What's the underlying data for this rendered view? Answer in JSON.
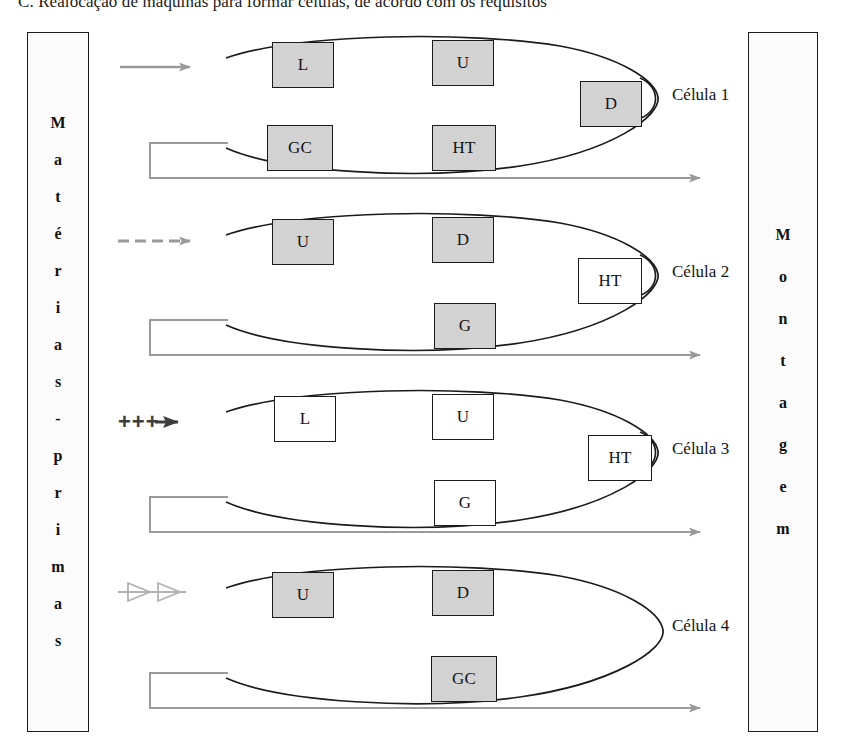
{
  "caption": {
    "text": "C. Realocação de máquinas para formar células, de acordo com os requisitos"
  },
  "panels": {
    "left": {
      "name": "Matérias-primas",
      "letters": [
        "M",
        "a",
        "t",
        "é",
        "r",
        "i",
        "a",
        "s",
        "-",
        "p",
        "r",
        "i",
        "m",
        "a",
        "s"
      ]
    },
    "right": {
      "name": "Montagem",
      "letters": [
        "M",
        "o",
        "n",
        "t",
        "a",
        "g",
        "e",
        "m"
      ]
    }
  },
  "colors": {
    "machine_fill": "#d2d2d2",
    "machine_plain_fill": "#ffffff",
    "outline": "#1b1b1b",
    "flow_arrow": "#9a9a9a",
    "plus_arrow": "#3d3d3d",
    "page_background": "#ffffff"
  },
  "cells": [
    {
      "id": "cell-1",
      "label": "Célula 1",
      "input_arrow": {
        "style": "solid-gray",
        "glyph": "→"
      },
      "machines": [
        {
          "code": "L",
          "fill": "gray",
          "position": "top-left"
        },
        {
          "code": "U",
          "fill": "gray",
          "position": "top-right"
        },
        {
          "code": "D",
          "fill": "gray",
          "position": "tip-right"
        },
        {
          "code": "GC",
          "fill": "gray",
          "position": "bottom-left"
        },
        {
          "code": "HT",
          "fill": "gray",
          "position": "bottom-right"
        }
      ],
      "return_line": true,
      "output_arrow": true
    },
    {
      "id": "cell-2",
      "label": "Célula 2",
      "input_arrow": {
        "style": "dashed-gray",
        "glyph": "⇢"
      },
      "machines": [
        {
          "code": "U",
          "fill": "gray",
          "position": "top-left"
        },
        {
          "code": "D",
          "fill": "gray",
          "position": "top-right"
        },
        {
          "code": "HT",
          "fill": "white",
          "position": "tip-right"
        },
        {
          "code": "G",
          "fill": "gray",
          "position": "bottom-right"
        }
      ],
      "return_line": true,
      "output_arrow": true
    },
    {
      "id": "cell-3",
      "label": "Célula 3",
      "input_arrow": {
        "style": "plus-solid",
        "glyph": "+++▶",
        "prefix": "+++"
      },
      "machines": [
        {
          "code": "L",
          "fill": "white",
          "position": "top-left"
        },
        {
          "code": "U",
          "fill": "gray",
          "position": "top-right"
        },
        {
          "code": "HT",
          "fill": "white",
          "position": "tip-right"
        },
        {
          "code": "G",
          "fill": "gray",
          "position": "bottom-right"
        }
      ],
      "return_line": true,
      "output_arrow": true
    },
    {
      "id": "cell-4",
      "label": "Célula 4",
      "input_arrow": {
        "style": "hollow-double",
        "glyph": "▷▷"
      },
      "machines": [
        {
          "code": "U",
          "fill": "gray",
          "position": "top-left"
        },
        {
          "code": "D",
          "fill": "gray",
          "position": "top-right"
        },
        {
          "code": "GC",
          "fill": "gray",
          "position": "bottom-right"
        }
      ],
      "return_line": true,
      "output_arrow": true
    }
  ]
}
